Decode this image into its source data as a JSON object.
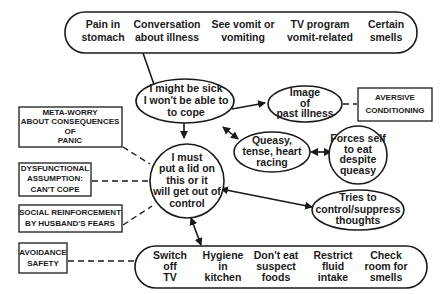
{
  "diagram": {
    "triggers": [
      "Pain in|stomach",
      "Conversation|about illness",
      "See vomit or|vomiting",
      "TV program|vomit-related",
      "Certain|smells"
    ],
    "thought": "I might be sick|I won't be able to|to cope",
    "image": "Image|of|past illness",
    "queasy": "Queasy,|tense, heart|racing",
    "forces": "Forces self|to eat|despite|queasy",
    "must": "I must|put a lid on|this or it|will get out of|control",
    "tries": "Tries to|control/suppress|thoughts",
    "behaviours": [
      "Switch|off|TV",
      "Hygiene|in|kitchen",
      "Don't eat|suspect|foods",
      "Restrict|fluid|intake",
      "Check|room for|smells"
    ],
    "boxes": {
      "aversive": "AVERSIVE|CONDITIONING",
      "meta": "META-WORRY|ABOUT CONSEQUENCES|OF|PANIC",
      "dysfunctional": "DYSFUNCTIONAL|ASSUMPTION:|CAN'T COPE",
      "social": "SOCIAL REINFORCEMENT|BY HUSBAND'S FEARS",
      "avoidance": "AVOIDANCE|SAFETY"
    }
  }
}
